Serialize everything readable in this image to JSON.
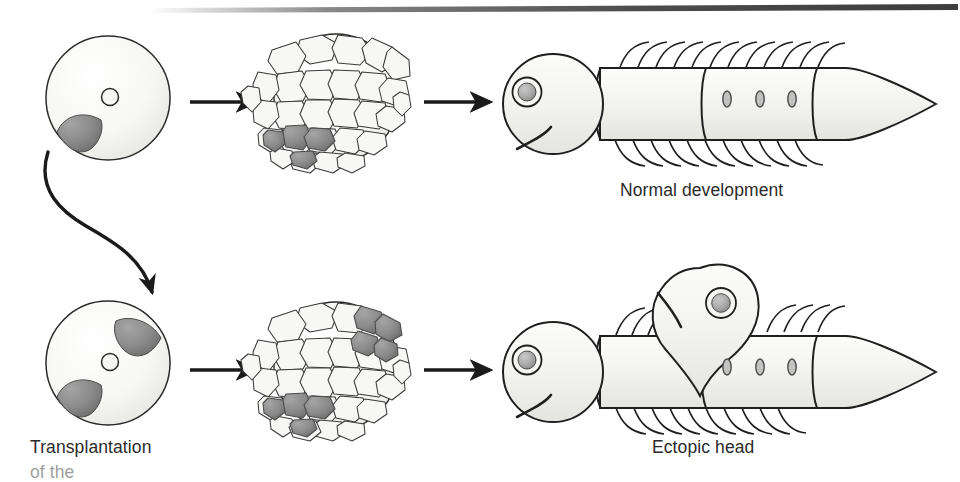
{
  "figure": {
    "background_color": "#ffffff",
    "ink_color": "#231f20",
    "cell_fill": "#f5f5f3",
    "organizer_gray": "#8d8d8d",
    "organizer_gray_dark": "#6e6e6e",
    "body_fill": "#f2f2f0"
  },
  "captions": {
    "normal": "Normal development",
    "transplantation": "Transplantation",
    "transplantation_cut": "of the",
    "ectopic": "Ectopic head"
  },
  "rows": [
    {
      "name": "normal-development-row",
      "stages": [
        {
          "name": "egg",
          "label": "egg with single organizer",
          "organizer_count": 1,
          "organizer_positions": [
            "lower-left"
          ]
        },
        {
          "name": "blastula",
          "label": "blastula with one gray cell patch",
          "patch_count": 1,
          "patch_positions": [
            "lower-left"
          ]
        },
        {
          "name": "larva",
          "label": "normal larva with one head",
          "head_count": 1,
          "spot_count": 3,
          "segments": 3
        }
      ]
    },
    {
      "name": "transplantation-row",
      "stages": [
        {
          "name": "egg",
          "label": "egg with two organizers",
          "organizer_count": 2,
          "organizer_positions": [
            "upper-right",
            "lower-left"
          ]
        },
        {
          "name": "blastula",
          "label": "blastula with two gray cell patches",
          "patch_count": 2,
          "patch_positions": [
            "upper-right",
            "lower-left"
          ]
        },
        {
          "name": "larva",
          "label": "larva with ectopic second head",
          "head_count": 2,
          "spot_count": 3,
          "segments": 3
        }
      ]
    }
  ],
  "arrows": {
    "straight_count": 4,
    "curved_label": "transplantation arrow",
    "style": "solid triangular head"
  }
}
